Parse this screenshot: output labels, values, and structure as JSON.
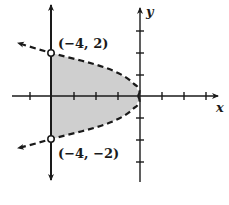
{
  "figure": {
    "axes": {
      "x_label": "x",
      "y_label": "y",
      "x_ticks": [
        -5,
        -4,
        -3,
        -2,
        -1,
        1,
        2,
        3
      ],
      "y_ticks": [
        -3,
        -2,
        -1,
        1,
        2,
        3
      ]
    },
    "curves": [
      {
        "name": "parabola",
        "equation": "x = -y^2",
        "style": "dashed",
        "arrows": "both ends, pointing left"
      },
      {
        "name": "vertical-line",
        "equation": "x = -4",
        "style": "solid",
        "arrows": "both ends"
      }
    ],
    "points": [
      {
        "label": "(−4, 2)",
        "x": -4,
        "y": 2,
        "marker": "open-circle"
      },
      {
        "label": "(−4, −2)",
        "x": -4,
        "y": -2,
        "marker": "open-circle"
      }
    ],
    "shading": {
      "region": "-y^2 > x > -4 (between line and parabola)",
      "color": "#cfcfcf"
    },
    "colors": {
      "ink": "#1a1a1a",
      "fill": "#cfcfcf",
      "background": "#ffffff"
    }
  }
}
